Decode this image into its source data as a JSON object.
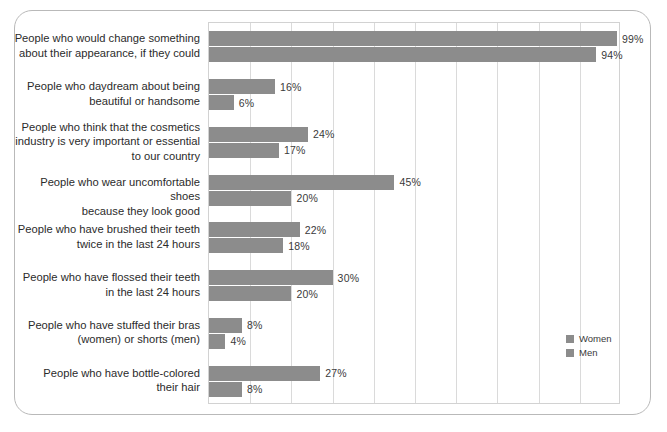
{
  "chart_data": {
    "type": "bar",
    "orientation": "horizontal",
    "title": "",
    "subtitle": "",
    "xlabel": "",
    "ylabel": "",
    "xlim": [
      0,
      100
    ],
    "xtick_step": 10,
    "xtick_labels": [],
    "grid": "vertical",
    "legend_position": "bottom-right",
    "value_suffix": "%",
    "bar_color": "#8c8c8c",
    "categories": [
      "People who would change something\nabout their appearance, if they could",
      "People who daydream about being\nbeautiful or handsome",
      "People who think that the cosmetics\nindustry is very important or essential\nto our country",
      "People who wear uncomfortable shoes\nbecause they look good",
      "People who have brushed their teeth\ntwice in the last 24 hours",
      "People who have flossed their teeth\nin the last 24 hours",
      "People who have stuffed their bras\n(women) or shorts (men)",
      "People who have bottle-colored\ntheir hair"
    ],
    "series": [
      {
        "name": "Women",
        "color": "#8c8c8c",
        "values": [
          99,
          16,
          24,
          45,
          22,
          30,
          8,
          27
        ],
        "labels": [
          "99%",
          "16%",
          "24%",
          "45%",
          "22%",
          "30%",
          "8%",
          "27%"
        ]
      },
      {
        "name": "Men",
        "color": "#8c8c8c",
        "values": [
          94,
          6,
          17,
          20,
          18,
          20,
          4,
          8
        ],
        "labels": [
          "94%",
          "6%",
          "17%",
          "20%",
          "18%",
          "20%",
          "4%",
          "8%"
        ]
      }
    ]
  },
  "legend": {
    "items": [
      {
        "label": "Women",
        "color": "#8c8c8c"
      },
      {
        "label": "Men",
        "color": "#8c8c8c"
      }
    ]
  }
}
